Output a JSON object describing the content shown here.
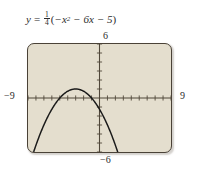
{
  "equation": {
    "lhs": "y",
    "equals": "=",
    "coefficient_numerator": "1",
    "coefficient_denominator": "4",
    "open_paren": "(",
    "term1": "−x",
    "term1_exponent": "2",
    "term2": "− 6x",
    "term3": "− 5",
    "close_paren": ")",
    "full_text": "y = 1/4(−x² − 6x − 5)"
  },
  "axis_labels": {
    "top": "6",
    "bottom": "−6",
    "left": "−9",
    "right": "9"
  },
  "colors": {
    "plot_background": "#e4dece",
    "frame_border": "#4a4237",
    "axis": "#4f4639",
    "curve": "#1a1a1a",
    "page_background": "#ffffff",
    "text": "#2b2b2b"
  },
  "chart_data": {
    "type": "line",
    "xlabel": "x",
    "ylabel": "y",
    "xlim": [
      -9,
      9
    ],
    "ylim": [
      -6,
      6
    ],
    "xtick_step": 1,
    "ytick_step": 1,
    "grid": false,
    "legend": "none",
    "function": "y = (1/4)(-x^2 - 6x - 5)",
    "vertex": [
      -3,
      1
    ],
    "x_intercepts": [
      -5,
      -1
    ],
    "y_intercept": -1.25,
    "opens": "down",
    "series": [
      {
        "name": "y = 1/4(-x^2 - 6x - 5)",
        "x": [
          -9,
          -8.5,
          -8,
          -7.5,
          -7,
          -6.5,
          -6,
          -5.5,
          -5,
          -4.5,
          -4,
          -3.5,
          -3,
          -2.5,
          -2,
          -1.5,
          -1,
          -0.5,
          0,
          0.5,
          1,
          1.5,
          2,
          2.5,
          3
        ],
        "y": [
          -5.0,
          -3.9375,
          -3.0,
          -2.1875,
          -1.5,
          -0.9375,
          -0.5,
          -0.1875,
          0.0,
          0.0625,
          0.0,
          -0.1875,
          0.25,
          0.0625,
          0.0,
          -0.1875,
          0.0,
          -0.5625,
          -1.25,
          -2.0625,
          -3.0,
          -4.0625,
          -5.25,
          -6.5625,
          -8.0
        ]
      }
    ]
  }
}
